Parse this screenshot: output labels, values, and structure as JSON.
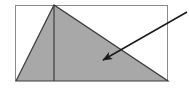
{
  "figure": {
    "canvas": {
      "width": 189,
      "height": 93,
      "background": "#ffffff"
    },
    "colors": {
      "shape_fill": "#a8a8a8",
      "shape_outline": "#3c3c3c",
      "rectangle_border": "#8a8a8a",
      "arrow": "#1a1a1a",
      "background": "#ffffff"
    },
    "shapes": {
      "rectangle": {
        "name": "bounding-rectangle",
        "x": 15,
        "y": 5,
        "width": 153,
        "height": 76,
        "stroke_width": 1,
        "fill": "none"
      },
      "triangle": {
        "name": "shaded-triangle",
        "points": "16,81 54,5 168,81",
        "vertices": [
          {
            "label": "bottom-left",
            "x": 16,
            "y": 81
          },
          {
            "label": "apex",
            "x": 54,
            "y": 5
          },
          {
            "label": "bottom-right",
            "x": 168,
            "y": 81
          }
        ],
        "stroke_width": 1.2
      },
      "altitude": {
        "name": "altitude-line",
        "x1": 54,
        "y1": 5,
        "x2": 54,
        "y2": 81,
        "stroke_width": 1.2
      }
    },
    "annotation": {
      "name": "pointer-arrow",
      "from": {
        "x": 187,
        "y": 12
      },
      "to": {
        "x": 103,
        "y": 60
      },
      "stroke_width": 1.6,
      "head_length": 11,
      "head_width": 5
    }
  }
}
